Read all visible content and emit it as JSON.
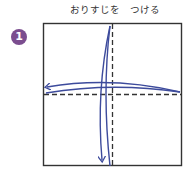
{
  "instruction": {
    "title": "おりすじを　つける",
    "step_number": "1"
  },
  "colors": {
    "badge": "#7b4d8f",
    "arrow": "#3d4b9c",
    "paper_edge": "#333333",
    "fold_line": "#333333"
  },
  "diagram": {
    "paper": "square",
    "fold_lines": [
      "vertical-center-dashed",
      "horizontal-center-dashed"
    ],
    "arrows": [
      "fold-right-to-left",
      "fold-top-to-bottom"
    ]
  }
}
